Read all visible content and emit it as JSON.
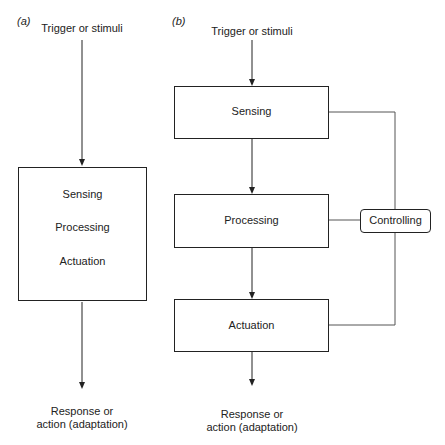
{
  "panel_a": {
    "label": "(a)",
    "input": "Trigger or stimuli",
    "box_items": [
      "Sensing",
      "Processing",
      "Actuation"
    ],
    "output_line1": "Response or",
    "output_line2": "action (adaptation)"
  },
  "panel_b": {
    "label": "(b)",
    "input": "Trigger or stimuli",
    "stages": [
      "Sensing",
      "Processing",
      "Actuation"
    ],
    "controller": "Controlling",
    "output_line1": "Response or",
    "output_line2": "action (adaptation)"
  }
}
